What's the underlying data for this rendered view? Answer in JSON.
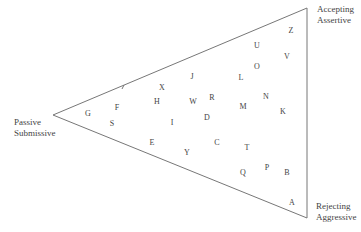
{
  "diagram": {
    "type": "triangle-scatter",
    "vertices": [
      {
        "id": "left",
        "x": 53,
        "y": 115,
        "label_lines": [
          "Passive",
          "Submissive"
        ],
        "label_x": 14,
        "label_y": 117
      },
      {
        "id": "top-right",
        "x": 307,
        "y": 8,
        "label_lines": [
          "Accepting",
          "Assertive"
        ],
        "label_x": 317,
        "label_y": 4
      },
      {
        "id": "bottom-right",
        "x": 307,
        "y": 218,
        "label_lines": [
          "Rejecting",
          "Aggressive"
        ],
        "label_x": 316,
        "label_y": 201
      }
    ],
    "line_color": "#777777",
    "points": [
      {
        "label": "X",
        "x": 162,
        "y": 88
      },
      {
        "label": "J",
        "x": 192,
        "y": 77
      },
      {
        "label": "U",
        "x": 257,
        "y": 46
      },
      {
        "label": "Z",
        "x": 291,
        "y": 31
      },
      {
        "label": "V",
        "x": 287,
        "y": 57
      },
      {
        "label": "O",
        "x": 257,
        "y": 67
      },
      {
        "label": "L",
        "x": 241,
        "y": 78
      },
      {
        "label": "R",
        "x": 212,
        "y": 98
      },
      {
        "label": "W",
        "x": 193,
        "y": 102
      },
      {
        "label": "H",
        "x": 157,
        "y": 102
      },
      {
        "label": "F",
        "x": 117,
        "y": 108
      },
      {
        "label": "G",
        "x": 88,
        "y": 114
      },
      {
        "label": "N",
        "x": 266,
        "y": 97
      },
      {
        "label": "M",
        "x": 243,
        "y": 107
      },
      {
        "label": "K",
        "x": 283,
        "y": 112
      },
      {
        "label": "S",
        "x": 112,
        "y": 124
      },
      {
        "label": "I",
        "x": 172,
        "y": 123
      },
      {
        "label": "D",
        "x": 207,
        "y": 118
      },
      {
        "label": "E",
        "x": 152,
        "y": 143
      },
      {
        "label": "Y",
        "x": 187,
        "y": 153
      },
      {
        "label": "C",
        "x": 217,
        "y": 143
      },
      {
        "label": "T",
        "x": 247,
        "y": 148
      },
      {
        "label": "Q",
        "x": 243,
        "y": 173
      },
      {
        "label": "P",
        "x": 267,
        "y": 168
      },
      {
        "label": "B",
        "x": 287,
        "y": 173
      },
      {
        "label": "A",
        "x": 292,
        "y": 203
      }
    ]
  }
}
